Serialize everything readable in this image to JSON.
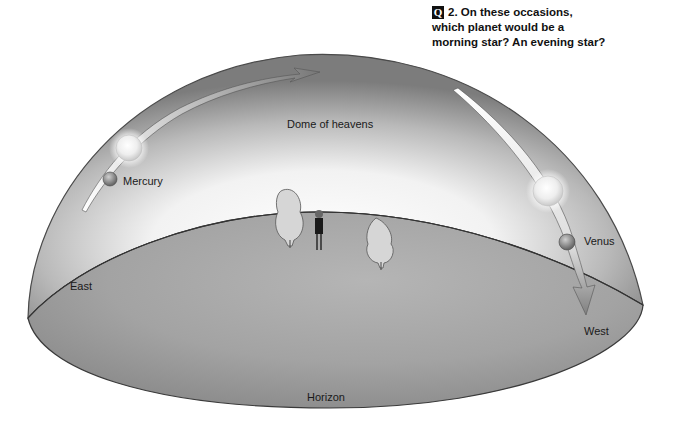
{
  "question": {
    "badge": "Q",
    "number": "2.",
    "text_line1": "On these occasions,",
    "text_line2": "which planet would be a",
    "text_line3": "morning star? An evening star?"
  },
  "labels": {
    "dome": "Dome of heavens",
    "mercury": "Mercury",
    "venus": "Venus",
    "east": "East",
    "west": "West",
    "horizon": "Horizon"
  },
  "colors": {
    "dome_edge": "#7a7a7a",
    "dome_glow": "#ffffff",
    "ground": "#9e9e9e",
    "outline": "#3a3a3a"
  }
}
